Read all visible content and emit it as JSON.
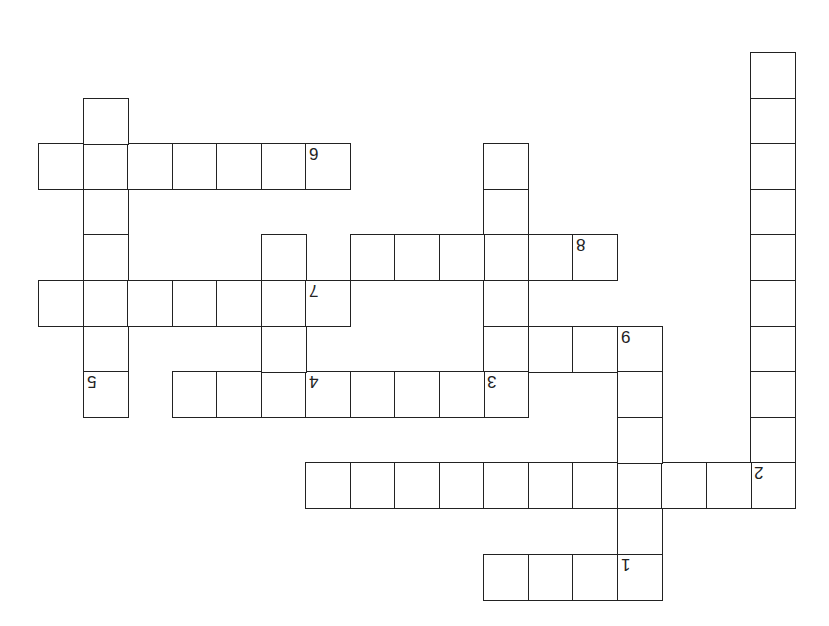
{
  "puzzle": {
    "type": "crossword",
    "orientation": "rotated-180",
    "border_color": "#222222",
    "cell_color": "#ffffff",
    "grid_origin": [
      38,
      52
    ],
    "cell_width": 44.5,
    "cell_height": 45.6,
    "clue_numbers": [
      "1",
      "2",
      "3",
      "4",
      "5",
      "6",
      "7",
      "8",
      "9"
    ],
    "cells": [
      {
        "c": 16,
        "r": 0
      },
      {
        "c": 16,
        "r": 1
      },
      {
        "c": 16,
        "r": 2
      },
      {
        "c": 16,
        "r": 3
      },
      {
        "c": 16,
        "r": 4
      },
      {
        "c": 16,
        "r": 5
      },
      {
        "c": 16,
        "r": 6
      },
      {
        "c": 16,
        "r": 7
      },
      {
        "c": 16,
        "r": 8
      },
      {
        "c": 16,
        "r": 9,
        "n": "2"
      },
      {
        "c": 6,
        "r": 9
      },
      {
        "c": 7,
        "r": 9
      },
      {
        "c": 8,
        "r": 9
      },
      {
        "c": 9,
        "r": 9
      },
      {
        "c": 10,
        "r": 9
      },
      {
        "c": 11,
        "r": 9
      },
      {
        "c": 12,
        "r": 9
      },
      {
        "c": 13,
        "r": 9
      },
      {
        "c": 14,
        "r": 9
      },
      {
        "c": 15,
        "r": 9
      },
      {
        "c": 13,
        "r": 6,
        "n": "9"
      },
      {
        "c": 13,
        "r": 7
      },
      {
        "c": 13,
        "r": 8
      },
      {
        "c": 13,
        "r": 10
      },
      {
        "c": 13,
        "r": 11,
        "n": "1"
      },
      {
        "c": 10,
        "r": 11
      },
      {
        "c": 11,
        "r": 11
      },
      {
        "c": 12,
        "r": 11
      },
      {
        "c": 10,
        "r": 6
      },
      {
        "c": 11,
        "r": 6
      },
      {
        "c": 12,
        "r": 6
      },
      {
        "c": 10,
        "r": 2
      },
      {
        "c": 10,
        "r": 3
      },
      {
        "c": 10,
        "r": 4
      },
      {
        "c": 10,
        "r": 5
      },
      {
        "c": 10,
        "r": 7,
        "n": "3"
      },
      {
        "c": 3,
        "r": 7
      },
      {
        "c": 4,
        "r": 7
      },
      {
        "c": 5,
        "r": 7
      },
      {
        "c": 6,
        "r": 7,
        "n": "4"
      },
      {
        "c": 7,
        "r": 7
      },
      {
        "c": 8,
        "r": 7
      },
      {
        "c": 9,
        "r": 7
      },
      {
        "c": 7,
        "r": 4
      },
      {
        "c": 8,
        "r": 4
      },
      {
        "c": 9,
        "r": 4
      },
      {
        "c": 11,
        "r": 4
      },
      {
        "c": 12,
        "r": 4,
        "n": "8"
      },
      {
        "c": 0,
        "r": 5
      },
      {
        "c": 1,
        "r": 5
      },
      {
        "c": 2,
        "r": 5
      },
      {
        "c": 3,
        "r": 5
      },
      {
        "c": 4,
        "r": 5
      },
      {
        "c": 5,
        "r": 5
      },
      {
        "c": 6,
        "r": 5,
        "n": "7"
      },
      {
        "c": 5,
        "r": 4
      },
      {
        "c": 5,
        "r": 6
      },
      {
        "c": 0,
        "r": 2
      },
      {
        "c": 1,
        "r": 2
      },
      {
        "c": 2,
        "r": 2
      },
      {
        "c": 3,
        "r": 2
      },
      {
        "c": 4,
        "r": 2
      },
      {
        "c": 5,
        "r": 2
      },
      {
        "c": 6,
        "r": 2,
        "n": "6"
      },
      {
        "c": 1,
        "r": 1
      },
      {
        "c": 1,
        "r": 3
      },
      {
        "c": 1,
        "r": 4
      },
      {
        "c": 1,
        "r": 6
      },
      {
        "c": 1,
        "r": 7,
        "n": "5"
      }
    ]
  }
}
